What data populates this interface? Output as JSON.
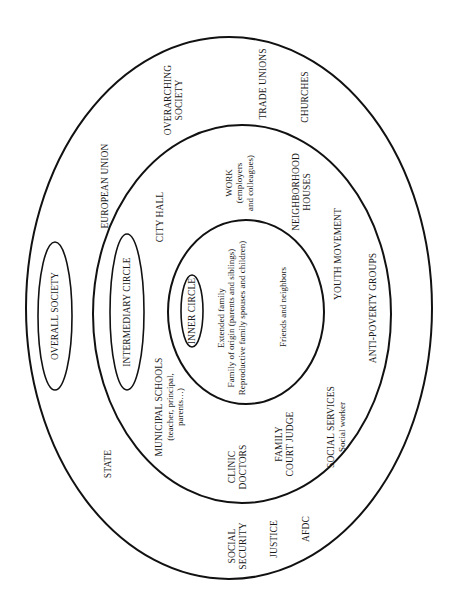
{
  "diagram": {
    "type": "concentric-ellipses",
    "rings": {
      "outer": {
        "name": "Overall society",
        "label": "OVERALL SOCIETY"
      },
      "middle": {
        "name": "Intermediary circle",
        "label": "INTERMEDIARY CIRCLE"
      },
      "inner": {
        "name": "Inner circle",
        "label": "INNER CIRCLE"
      }
    },
    "outer_ring_items": {
      "european_union": "EUROPEAN UNION",
      "overarching_society": [
        "OVERARCHING",
        "SOCIETY"
      ],
      "trade_unions": "TRADE UNIONS",
      "churches": "CHURCHES",
      "state": "STATE",
      "social_security": [
        "SOCIAL",
        "SECURITY"
      ],
      "justice": "JUSTICE",
      "afdc": "AFDC"
    },
    "middle_ring_items": {
      "city_hall": "CITY HALL",
      "work": [
        "WORK",
        "(employers",
        "and colleagues)"
      ],
      "neighborhood_houses": [
        "NEIGHBORHOOD",
        "HOUSES"
      ],
      "youth_movement": "YOUTH MOVEMENT",
      "anti_poverty_groups": "ANTI-POVERTY GROUPS",
      "municipal_schools": [
        "MUNICIPAL SCHOOLS",
        "(teacher, principal,",
        "parents…)"
      ],
      "clinic_doctors": [
        "CLINIC",
        "DOCTORS"
      ],
      "family_court_judge": [
        "FAMILY",
        "COURT JUDGE"
      ],
      "social_services": [
        "SOCIAL SERVICES",
        "Social worker"
      ]
    },
    "inner_ring_items": {
      "family": [
        "Extended family",
        "Family of origin (parents and siblings)",
        "Reproductive family spouses and children)"
      ],
      "friends": "Friends and neighbors"
    }
  }
}
